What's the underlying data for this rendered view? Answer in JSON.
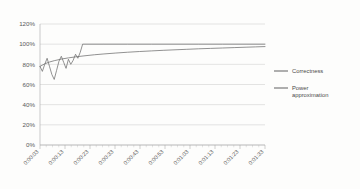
{
  "chart_data": {
    "type": "line",
    "title": "",
    "xlabel": "",
    "ylabel": "",
    "ylim": [
      0,
      120
    ],
    "ytick_labels": [
      "0%",
      "20%",
      "40%",
      "60%",
      "80%",
      "100%",
      "120%"
    ],
    "ytick_values": [
      0,
      20,
      40,
      60,
      80,
      100,
      120
    ],
    "grid": true,
    "legend_position": "right",
    "x_tick_interval_seconds": 10,
    "xtick_labels": [
      "0:00:03",
      "0:00:13",
      "0:00:23",
      "0:00:33",
      "0:00:43",
      "0:00:53",
      "0:01:03",
      "0:01:13",
      "0:01:23",
      "0:01:33"
    ],
    "xlim": [
      3,
      98
    ],
    "series": [
      {
        "name": "Correctness",
        "color": "#6e6e6e",
        "x": [
          3,
          4,
          5,
          6,
          7,
          8,
          9,
          10,
          11,
          12,
          13,
          14,
          15,
          16,
          17,
          18,
          19,
          20,
          21,
          22,
          30,
          40,
          50,
          60,
          70,
          80,
          90,
          98
        ],
        "values": [
          78,
          73,
          80,
          86,
          78,
          70,
          65,
          74,
          83,
          88,
          82,
          76,
          85,
          80,
          84,
          90,
          86,
          92,
          100,
          100,
          100,
          100,
          100,
          100,
          100,
          100,
          100,
          100
        ]
      },
      {
        "name": "Power approximation",
        "color": "#6e6e6e",
        "x": [
          3,
          5,
          7,
          9,
          12,
          15,
          18,
          22,
          26,
          30,
          35,
          40,
          45,
          50,
          55,
          60,
          65,
          70,
          75,
          80,
          85,
          90,
          94,
          98
        ],
        "values": [
          78,
          80.5,
          82.3,
          83.6,
          85.2,
          86.4,
          87.4,
          88.5,
          89.5,
          90.3,
          91.2,
          92.0,
          92.7,
          93.3,
          93.9,
          94.4,
          94.9,
          95.4,
          95.8,
          96.2,
          96.6,
          97.0,
          97.3,
          97.6
        ]
      }
    ]
  },
  "legend": {
    "items": [
      {
        "label": "Correctness",
        "label_line2": ""
      },
      {
        "label": "Power",
        "label_line2": "approximation"
      }
    ]
  }
}
